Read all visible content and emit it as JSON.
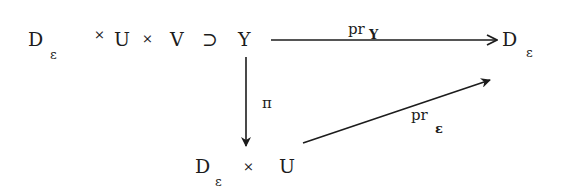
{
  "diagram": {
    "type": "commutative-diagram",
    "top_row": {
      "d1": "D",
      "d1_sub": "ε",
      "times1": "×",
      "u": "U",
      "times2": "×",
      "v": "V",
      "supset": "⊃",
      "y": "Y"
    },
    "target": {
      "d": "D",
      "d_sub": "ε"
    },
    "bottom": {
      "d": "D",
      "d_sub": "ε",
      "times": "×",
      "u": "U"
    },
    "arrows": [
      {
        "id": "prY",
        "label_main": "pr",
        "label_sub": "Y",
        "from": "Y",
        "to": "Dε",
        "direction": "horizontal"
      },
      {
        "id": "pi",
        "label_main": "π",
        "from": "Y",
        "to": "Dε × U",
        "direction": "vertical-down"
      },
      {
        "id": "prE",
        "label_main": "pr",
        "label_sub": "ε",
        "from": "Dε × U",
        "to": "Dε",
        "direction": "diagonal-up"
      }
    ],
    "colors": {
      "ink": "#1c1c1c",
      "background": "#ffffff"
    }
  }
}
